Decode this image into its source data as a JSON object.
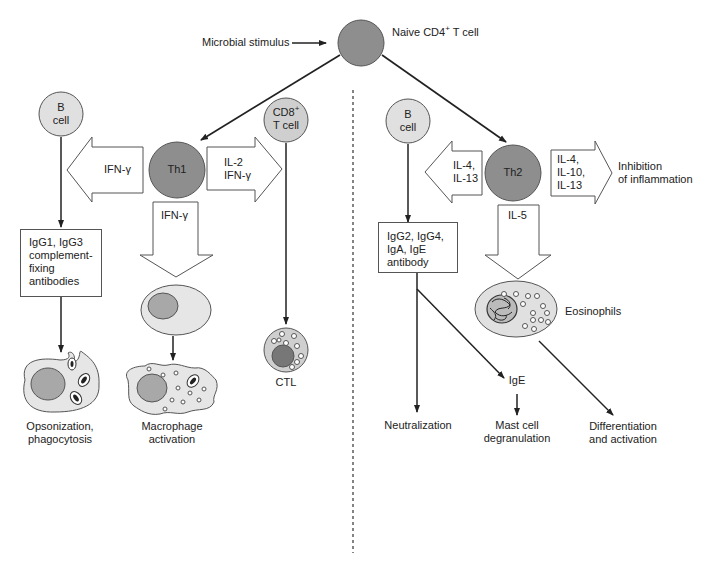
{
  "diagram": {
    "top": {
      "stimulus_label": "Microbial stimulus",
      "naive_cell_label": "Naive CD4",
      "naive_cell_sup": "+",
      "naive_cell_suffix": " T cell"
    },
    "th1": {
      "cell_label": "Th1",
      "b_cell_label_1": "B",
      "b_cell_label_2": "cell",
      "left_arrow_label": "IFN-γ",
      "right_arrow_label_1": "IL-2",
      "right_arrow_label_2": "IFN-γ",
      "down_arrow_label": "IFN-γ",
      "cd8_label_1": "CD8",
      "cd8_sup": "+",
      "cd8_label_2": "T cell",
      "antibody_box": [
        "IgG1, IgG3",
        "complement-",
        "fixing",
        "antibodies"
      ],
      "opsonization_label_1": "Opsonization,",
      "opsonization_label_2": "phagocytosis",
      "macrophage_label_1": "Macrophage",
      "macrophage_label_2": "activation",
      "ctl_label": "CTL"
    },
    "th2": {
      "cell_label": "Th2",
      "b_cell_label_1": "B",
      "b_cell_label_2": "cell",
      "left_arrow_label_1": "IL-4,",
      "left_arrow_label_2": "IL-13",
      "right_arrow_label_1": "IL-4,",
      "right_arrow_label_2": "IL-10,",
      "right_arrow_label_3": "IL-13",
      "inhibition_label_1": "Inhibition",
      "inhibition_label_2": "of inflammation",
      "down_arrow_label": "IL-5",
      "antibody_box": [
        "IgG2, IgG4,",
        "IgA, IgE",
        "antibody"
      ],
      "eosinophils_label": "Eosinophils",
      "ige_label": "IgE",
      "neutralization_label": "Neutralization",
      "mast_cell_label_1": "Mast cell",
      "mast_cell_label_2": "degranulation",
      "differentiation_label_1": "Differentiation",
      "differentiation_label_2": "and activation"
    },
    "colors": {
      "dark_cell": "#8e8e8e",
      "light_cell": "#e0e0e0",
      "nucleus": "#a8a8a8",
      "stroke": "#222222"
    }
  }
}
